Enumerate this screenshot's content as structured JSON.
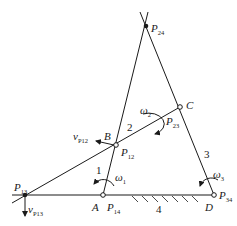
{
  "points": {
    "A": {
      "label": "A",
      "center_label": "P",
      "center_sub": "14"
    },
    "B": {
      "label": "B",
      "center_label": "P",
      "center_sub": "12"
    },
    "C": {
      "label": "C"
    },
    "D": {
      "label": "D",
      "center_label": "P",
      "center_sub": "34"
    },
    "P13": {
      "label": "P",
      "sub": "13"
    },
    "P24": {
      "label": "P",
      "sub": "24"
    },
    "P23": {
      "label": "P",
      "sub": "23"
    }
  },
  "links": {
    "link1": "1",
    "link2": "2",
    "link3": "3",
    "link4": "4"
  },
  "angular_velocities": {
    "w1": {
      "label": "ω",
      "sub": "1"
    },
    "w2": {
      "label": "ω",
      "sub": "2"
    },
    "w3": {
      "label": "ω",
      "sub": "3"
    }
  },
  "velocities": {
    "vP12": {
      "label": "v",
      "sub": "P12"
    },
    "vP13": {
      "label": "v",
      "sub": "P13"
    }
  }
}
